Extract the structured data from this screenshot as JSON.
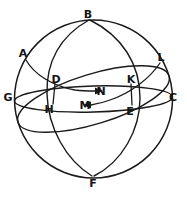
{
  "figure": {
    "type": "geometry-diagram",
    "background_color": "#ffffff",
    "line_color": "#1a1a1a",
    "label_color": "#141414"
  },
  "points": [
    {
      "id": "A",
      "label": "A",
      "x": 23,
      "y": 53,
      "role": "circle-point"
    },
    {
      "id": "B",
      "label": "B",
      "x": 88,
      "y": 14,
      "role": "pole-top"
    },
    {
      "id": "C",
      "label": "C",
      "x": 173,
      "y": 97,
      "role": "equator-right"
    },
    {
      "id": "D",
      "label": "D",
      "x": 56,
      "y": 79,
      "role": "intersection"
    },
    {
      "id": "E",
      "label": "E",
      "x": 130,
      "y": 111,
      "role": "intersection"
    },
    {
      "id": "F",
      "label": "F",
      "x": 93,
      "y": 183,
      "role": "pole-bottom"
    },
    {
      "id": "G",
      "label": "G",
      "x": 8,
      "y": 97,
      "role": "equator-left"
    },
    {
      "id": "H",
      "label": "H",
      "x": 49,
      "y": 109,
      "role": "foot-point"
    },
    {
      "id": "K",
      "label": "K",
      "x": 131,
      "y": 79,
      "role": "intersection"
    },
    {
      "id": "L",
      "label": "L",
      "x": 161,
      "y": 57,
      "role": "circle-point"
    },
    {
      "id": "M",
      "label": "M",
      "x": 85,
      "y": 105,
      "role": "center-lower"
    },
    {
      "id": "N",
      "label": "N",
      "x": 101,
      "y": 91,
      "role": "center-upper"
    }
  ],
  "arrows": [
    {
      "id": "arrow-to-N",
      "from": "D",
      "to": "N",
      "direction": "right"
    },
    {
      "id": "arrow-to-M",
      "from": "E",
      "to": "M",
      "direction": "left"
    }
  ],
  "curves": [
    {
      "id": "sphere-outline",
      "kind": "circle",
      "description": "sphere boundary great circle"
    },
    {
      "id": "equator-ellipse",
      "kind": "ellipse",
      "description": "horizontal great circle through G, C"
    },
    {
      "id": "tilted-ellipse",
      "kind": "ellipse",
      "description": "tilted great circle through A, L"
    },
    {
      "id": "meridian-b-f-left",
      "kind": "arc",
      "description": "meridian arc from B through D to F"
    },
    {
      "id": "meridian-b-f-right",
      "kind": "arc",
      "description": "meridian arc from B through K to F"
    },
    {
      "id": "segment-d-h",
      "kind": "segment",
      "description": "vertical segment from D to H"
    },
    {
      "id": "segment-k-e",
      "kind": "segment",
      "description": "vertical segment from K to E"
    },
    {
      "id": "segment-a-n",
      "kind": "arc",
      "description": "arc from A through D to N"
    },
    {
      "id": "segment-l-m",
      "kind": "arc",
      "description": "arc from L through K to M"
    }
  ]
}
